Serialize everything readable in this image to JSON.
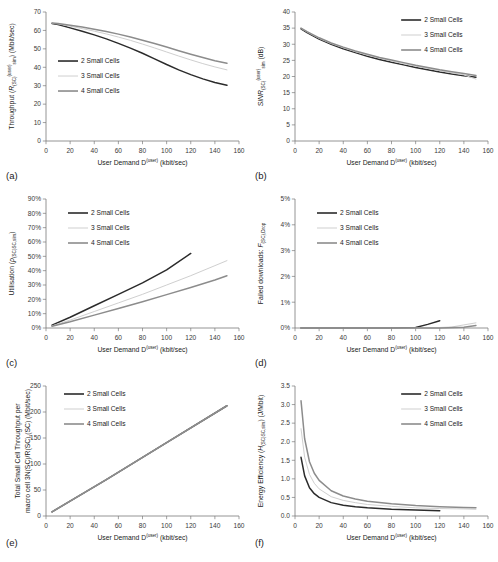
{
  "figure": {
    "series_names": [
      "2 Small Cells",
      "3 Small Cells",
      "4 Small Cells"
    ],
    "series_colors": [
      "#2b2b2b",
      "#cfcfcf",
      "#8c8c8c"
    ],
    "xlabel_main": "User Demand D",
    "xlabel_sup": "(user)",
    "xlabel_unit": " (kbit/sec)",
    "xticks": [
      "0",
      "20",
      "40",
      "60",
      "80",
      "100",
      "120",
      "140",
      "160"
    ],
    "xlim": [
      0,
      160
    ]
  },
  "chart_data": [
    {
      "id": "a",
      "panel_label": "(a)",
      "type": "line",
      "title": "",
      "xlabel": "User Demand D(user) (kbit/sec)",
      "ylabel": "Throughput (R_SC)(user)_sim (Mbit/sec)",
      "ylabel_parts": {
        "pre": "Throughput (",
        "italic": "R",
        "sub1": "(SC)",
        "sup": "(user)",
        "sub2": "sim",
        "post": ") (Mbit/sec)"
      },
      "xlim": [
        0,
        160
      ],
      "ylim": [
        0,
        70
      ],
      "xticks": [
        0,
        20,
        40,
        60,
        80,
        100,
        120,
        140,
        160
      ],
      "yticks": [
        0,
        10,
        20,
        30,
        40,
        50,
        60,
        70
      ],
      "ytick_labels": [
        "0",
        "10",
        "20",
        "30",
        "40",
        "50",
        "60",
        "70"
      ],
      "grid": false,
      "legend_position": "center-left",
      "series": [
        {
          "name": "2 Small Cells",
          "color": "#2b2b2b",
          "x": [
            5,
            10,
            20,
            30,
            40,
            50,
            60,
            70,
            80,
            90,
            100,
            110,
            120,
            130,
            140,
            150
          ],
          "y": [
            63.8,
            63.2,
            61.4,
            59.6,
            57.6,
            55.4,
            53.0,
            50.4,
            47.6,
            44.6,
            41.5,
            38.6,
            36.0,
            33.7,
            31.7,
            30.2
          ]
        },
        {
          "name": "3 Small Cells",
          "color": "#cfcfcf",
          "x": [
            5,
            10,
            20,
            30,
            40,
            50,
            60,
            70,
            80,
            90,
            100,
            110,
            120,
            130,
            140,
            150
          ],
          "y": [
            63.9,
            63.5,
            62.3,
            61.0,
            59.6,
            58.1,
            56.4,
            54.6,
            52.6,
            50.5,
            48.3,
            46.1,
            44.0,
            42.0,
            40.2,
            38.6
          ]
        },
        {
          "name": "4 Small Cells",
          "color": "#8c8c8c",
          "x": [
            5,
            10,
            20,
            30,
            40,
            50,
            60,
            70,
            80,
            90,
            100,
            110,
            120,
            130,
            140,
            150
          ],
          "y": [
            64.0,
            63.7,
            62.8,
            61.8,
            60.7,
            59.4,
            58.0,
            56.4,
            54.7,
            52.9,
            51.0,
            49.0,
            47.1,
            45.3,
            43.6,
            42.2
          ]
        }
      ]
    },
    {
      "id": "b",
      "panel_label": "(b)",
      "type": "line",
      "title": "",
      "xlabel": "User Demand D(user) (kbit/sec)",
      "ylabel": "SINR_(SC)(user)_sim (dB)",
      "ylabel_parts": {
        "pre": "",
        "italic": "SINR",
        "sub1": "(SC)",
        "sup": "(user)",
        "sub2": "sim",
        "post": " (dB)"
      },
      "xlim": [
        0,
        160
      ],
      "ylim": [
        0,
        40
      ],
      "xticks": [
        0,
        20,
        40,
        60,
        80,
        100,
        120,
        140,
        160
      ],
      "yticks": [
        0,
        5,
        10,
        15,
        20,
        25,
        30,
        35,
        40
      ],
      "ytick_labels": [
        "0",
        "5",
        "10",
        "15",
        "20",
        "25",
        "30",
        "35",
        "40"
      ],
      "grid": false,
      "legend_position": "top-right",
      "series": [
        {
          "name": "2 Small Cells",
          "color": "#2b2b2b",
          "x": [
            5,
            10,
            20,
            30,
            40,
            50,
            60,
            70,
            80,
            90,
            100,
            110,
            120,
            130,
            140,
            150
          ],
          "y": [
            34.8,
            33.6,
            31.6,
            30.0,
            28.6,
            27.4,
            26.3,
            25.3,
            24.4,
            23.6,
            22.8,
            22.1,
            21.4,
            20.8,
            20.2,
            19.8
          ]
        },
        {
          "name": "3 Small Cells",
          "color": "#cfcfcf",
          "x": [
            5,
            10,
            20,
            30,
            40,
            50,
            60,
            70,
            80,
            90,
            100,
            110,
            120,
            130,
            140,
            150
          ],
          "y": [
            34.9,
            33.8,
            31.8,
            30.2,
            28.9,
            27.7,
            26.6,
            25.7,
            24.8,
            24.0,
            23.2,
            22.5,
            21.8,
            21.1,
            20.5,
            19.2
          ]
        },
        {
          "name": "4 Small Cells",
          "color": "#8c8c8c",
          "x": [
            5,
            10,
            20,
            30,
            40,
            50,
            60,
            70,
            80,
            90,
            100,
            110,
            120,
            130,
            140,
            150
          ],
          "y": [
            35.0,
            33.9,
            32.0,
            30.4,
            29.1,
            27.9,
            26.9,
            25.9,
            25.1,
            24.3,
            23.5,
            22.8,
            22.1,
            21.5,
            20.9,
            20.3
          ]
        }
      ]
    },
    {
      "id": "c",
      "panel_label": "(c)",
      "type": "line",
      "title": "",
      "xlabel": "User Demand D(user) (kbit/sec)",
      "ylabel": "Utilisation (rho_SC)_SC,sim",
      "ylabel_parts": {
        "pre": "Utilisation (",
        "italic": "ρ",
        "sub1": "(SC)",
        "sup": "",
        "sub2": "SC,sim",
        "post": ")"
      },
      "xlim": [
        0,
        160
      ],
      "ylim": [
        0,
        90
      ],
      "xticks": [
        0,
        20,
        40,
        60,
        80,
        100,
        120,
        140,
        160
      ],
      "yticks": [
        0,
        10,
        20,
        30,
        40,
        50,
        60,
        70,
        80,
        90
      ],
      "ytick_labels": [
        "0%",
        "10%",
        "20%",
        "30%",
        "40%",
        "50%",
        "60%",
        "70%",
        "80%",
        "90%"
      ],
      "grid": false,
      "legend_position": "top-left",
      "series": [
        {
          "name": "2 Small Cells",
          "color": "#2b2b2b",
          "x": [
            5,
            20,
            40,
            60,
            80,
            100,
            120
          ],
          "y": [
            2.0,
            7.5,
            15.5,
            23.5,
            31.5,
            40.5,
            52.0
          ]
        },
        {
          "name": "3 Small Cells",
          "color": "#cfcfcf",
          "x": [
            5,
            20,
            40,
            60,
            80,
            100,
            120,
            140,
            150
          ],
          "y": [
            1.5,
            5.5,
            11.5,
            17.5,
            23.5,
            30.0,
            36.5,
            43.5,
            47.0
          ]
        },
        {
          "name": "4 Small Cells",
          "color": "#8c8c8c",
          "x": [
            5,
            20,
            40,
            60,
            80,
            100,
            120,
            140,
            150
          ],
          "y": [
            1.2,
            4.3,
            9.0,
            13.6,
            18.3,
            23.3,
            28.3,
            33.5,
            36.5
          ]
        }
      ]
    },
    {
      "id": "d",
      "panel_label": "(d)",
      "type": "line",
      "title": "",
      "xlabel": "User Demand D(user) (kbit/sec)",
      "ylabel": "Failed downloads: F_(SC),Drop",
      "ylabel_parts": {
        "pre": "Failed downloads: ",
        "italic": "F",
        "sub1": "(SC),Drop",
        "sup": "",
        "sub2": "",
        "post": ""
      },
      "xlim": [
        0,
        160
      ],
      "ylim": [
        0,
        5
      ],
      "xticks": [
        0,
        20,
        40,
        60,
        80,
        100,
        120,
        140,
        160
      ],
      "yticks": [
        0,
        1,
        2,
        3,
        4,
        5
      ],
      "ytick_labels": [
        "0%",
        "1%",
        "2%",
        "3%",
        "4%",
        "5%"
      ],
      "grid": false,
      "legend_position": "top-left",
      "series": [
        {
          "name": "2 Small Cells",
          "color": "#2b2b2b",
          "x": [
            5,
            40,
            80,
            100,
            110,
            120
          ],
          "y": [
            0.0,
            0.0,
            0.0,
            0.02,
            0.14,
            0.28
          ]
        },
        {
          "name": "3 Small Cells",
          "color": "#cfcfcf",
          "x": [
            5,
            40,
            80,
            110,
            130,
            140,
            150
          ],
          "y": [
            0.0,
            0.0,
            0.0,
            0.0,
            0.04,
            0.12,
            0.2
          ]
        },
        {
          "name": "4 Small Cells",
          "color": "#8c8c8c",
          "x": [
            5,
            40,
            80,
            120,
            140,
            150
          ],
          "y": [
            0.0,
            0.0,
            0.0,
            0.0,
            0.03,
            0.1
          ]
        }
      ]
    },
    {
      "id": "e",
      "panel_label": "(e)",
      "type": "line",
      "title": "",
      "xlabel": "User Demand D(user) (kbit/sec)",
      "ylabel": "Total Small Cell Throughput per macro cell 3N_(SC)/R_SC,(SC) (Mbit/sec)",
      "ylabel_parts": {
        "pre": "Total Small Cell Throughput per macro cell 3",
        "italic": "N",
        "sub1": "(SC)",
        "sup": "",
        "sub2": "",
        "post": "/R_SC,(SC) (Mbit/sec)"
      },
      "xlim": [
        0,
        160
      ],
      "ylim": [
        0,
        250
      ],
      "xticks": [
        0,
        20,
        40,
        60,
        80,
        100,
        120,
        140,
        160
      ],
      "yticks": [
        0,
        50,
        100,
        150,
        200,
        250
      ],
      "ytick_labels": [
        "0",
        "50",
        "100",
        "150",
        "200",
        "250"
      ],
      "grid": false,
      "legend_position": "top-center",
      "series": [
        {
          "name": "2 Small Cells",
          "color": "#2b2b2b",
          "x": [
            5,
            50,
            100,
            150
          ],
          "y": [
            8,
            70,
            141,
            212
          ]
        },
        {
          "name": "3 Small Cells",
          "color": "#cfcfcf",
          "x": [
            5,
            50,
            100,
            150
          ],
          "y": [
            8,
            70,
            141,
            212
          ]
        },
        {
          "name": "4 Small Cells",
          "color": "#8c8c8c",
          "x": [
            5,
            50,
            100,
            150
          ],
          "y": [
            8,
            70,
            141,
            212
          ]
        }
      ]
    },
    {
      "id": "f",
      "panel_label": "(f)",
      "type": "line",
      "title": "",
      "xlabel": "User Demand D(user) (kbit/sec)",
      "ylabel": "Energy Efficiency (H_(SC))_SC,sim (J/Mbit)",
      "ylabel_parts": {
        "pre": "Energy Efficiency (",
        "italic": "H",
        "sub1": "(SC)",
        "sup": "",
        "sub2": "SC,sim",
        "post": ") (J/Mbit)"
      },
      "xlim": [
        0,
        160
      ],
      "ylim": [
        0,
        3.5
      ],
      "xticks": [
        0,
        20,
        40,
        60,
        80,
        100,
        120,
        140,
        160
      ],
      "yticks": [
        0,
        0.5,
        1.0,
        1.5,
        2.0,
        2.5,
        3.0,
        3.5
      ],
      "ytick_labels": [
        "0.0",
        "0.5",
        "1.0",
        "1.5",
        "2.0",
        "2.5",
        "3.0",
        "3.5"
      ],
      "grid": false,
      "legend_position": "top-right",
      "series": [
        {
          "name": "2 Small Cells",
          "color": "#2b2b2b",
          "x": [
            5,
            8,
            12,
            16,
            20,
            30,
            40,
            50,
            60,
            80,
            100,
            120
          ],
          "y": [
            1.58,
            1.08,
            0.76,
            0.6,
            0.5,
            0.36,
            0.29,
            0.25,
            0.22,
            0.18,
            0.16,
            0.14
          ]
        },
        {
          "name": "3 Small Cells",
          "color": "#cfcfcf",
          "x": [
            5,
            8,
            12,
            16,
            20,
            30,
            40,
            50,
            60,
            80,
            100,
            120,
            140,
            150
          ],
          "y": [
            2.35,
            1.58,
            1.12,
            0.88,
            0.73,
            0.52,
            0.42,
            0.36,
            0.31,
            0.26,
            0.22,
            0.2,
            0.19,
            0.18
          ]
        },
        {
          "name": "4 Small Cells",
          "color": "#8c8c8c",
          "x": [
            5,
            8,
            12,
            16,
            20,
            30,
            40,
            50,
            60,
            80,
            100,
            120,
            140,
            150
          ],
          "y": [
            3.1,
            2.08,
            1.46,
            1.15,
            0.96,
            0.68,
            0.54,
            0.46,
            0.4,
            0.33,
            0.28,
            0.25,
            0.23,
            0.22
          ]
        }
      ]
    }
  ]
}
